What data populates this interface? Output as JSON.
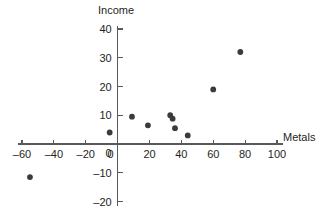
{
  "chart_data": {
    "type": "scatter",
    "title": "",
    "xlabel": "Metals",
    "ylabel": "Income",
    "xlim": [
      -60,
      100
    ],
    "ylim": [
      -20,
      40
    ],
    "grid": false,
    "legend": false,
    "x_ticks": [
      -60,
      -40,
      -20,
      0,
      20,
      40,
      60,
      80,
      100
    ],
    "x_tick_labels": [
      "–60",
      "–40",
      "–20",
      "0",
      "20",
      "40",
      "60",
      "80",
      "100"
    ],
    "y_ticks": [
      -20,
      -10,
      0,
      10,
      20,
      30,
      40
    ],
    "y_tick_labels": [
      "–20",
      "–10",
      "0",
      "10",
      "20",
      "30",
      "40"
    ],
    "points": [
      {
        "x": -55,
        "y": -11.5
      },
      {
        "x": -5,
        "y": 4
      },
      {
        "x": 9,
        "y": 9.5
      },
      {
        "x": 19,
        "y": 6.5
      },
      {
        "x": 33,
        "y": 10
      },
      {
        "x": 34.5,
        "y": 8.8
      },
      {
        "x": 36,
        "y": 5.5
      },
      {
        "x": 44,
        "y": 3
      },
      {
        "x": 60,
        "y": 19
      },
      {
        "x": 77,
        "y": 32
      }
    ],
    "marker": {
      "shape": "circle",
      "radius_px": 2.9,
      "color": "#3b3b3d"
    },
    "axis_color": "#58595b"
  }
}
